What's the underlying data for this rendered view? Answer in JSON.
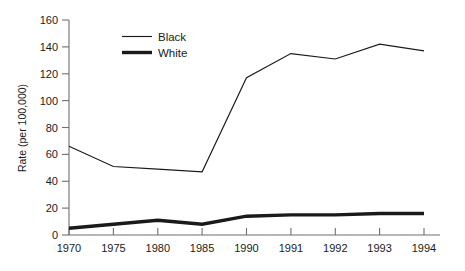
{
  "chart_data": {
    "type": "line",
    "title": "",
    "xlabel": "",
    "ylabel": "Rate (per 100,000)",
    "categories": [
      "1970",
      "1975",
      "1980",
      "1985",
      "1990",
      "1991",
      "1992",
      "1993",
      "1994"
    ],
    "series": [
      {
        "name": "Black",
        "line_style": "thin",
        "color": "#1a1a1a",
        "values": [
          66,
          51,
          49,
          47,
          117,
          135,
          131,
          142,
          137
        ]
      },
      {
        "name": "White",
        "line_style": "thick",
        "color": "#1a1a1a",
        "values": [
          5,
          8,
          11,
          8,
          14,
          15,
          15,
          16,
          16
        ]
      }
    ],
    "ylim": [
      0,
      160
    ],
    "yticks": [
      0,
      20,
      40,
      60,
      80,
      100,
      120,
      140,
      160
    ],
    "ytick_labels": [
      "0",
      "20",
      "40",
      "60",
      "80",
      "100",
      "120",
      "140",
      "160"
    ],
    "grid": false,
    "legend_position": "top-left-inside",
    "legend_entries": [
      {
        "label": "Black",
        "weight": "thin"
      },
      {
        "label": "White",
        "weight": "thick"
      }
    ]
  },
  "legend": {
    "black_label": "Black",
    "white_label": "White"
  },
  "axes": {
    "y_title": "Rate (per 100,000)",
    "y_labels": [
      "160",
      "140",
      "120",
      "100",
      "80",
      "60",
      "40",
      "20",
      "0"
    ],
    "x_labels": [
      "1970",
      "1975",
      "1980",
      "1985",
      "1990",
      "1991",
      "1992",
      "1993",
      "1994"
    ]
  }
}
